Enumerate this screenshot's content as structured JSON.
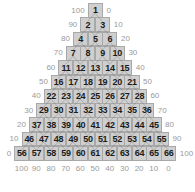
{
  "diagram": {
    "type": "ternary-triangle-grid",
    "rows": [
      [
        1
      ],
      [
        2,
        3
      ],
      [
        4,
        5,
        6
      ],
      [
        7,
        8,
        9,
        10
      ],
      [
        11,
        12,
        13,
        14,
        15
      ],
      [
        16,
        17,
        18,
        19,
        20,
        21
      ],
      [
        22,
        23,
        24,
        25,
        26,
        27,
        28
      ],
      [
        29,
        30,
        31,
        32,
        33,
        34,
        35,
        36
      ],
      [
        37,
        38,
        39,
        40,
        41,
        42,
        43,
        44,
        45
      ],
      [
        46,
        47,
        48,
        49,
        50,
        51,
        52,
        53,
        54,
        55
      ],
      [
        56,
        57,
        58,
        59,
        60,
        61,
        62,
        63,
        64,
        65,
        66
      ]
    ],
    "left_axis_labels": [
      "100",
      "90",
      "80",
      "70",
      "60",
      "50",
      "40",
      "30",
      "20",
      "10",
      "0"
    ],
    "right_axis_labels": [
      "0",
      "10",
      "20",
      "30",
      "40",
      "50",
      "60",
      "70",
      "80",
      "90",
      "100"
    ],
    "bottom_axis_labels": [
      "100",
      "90",
      "80",
      "70",
      "60",
      "50",
      "40",
      "30",
      "20",
      "10",
      "0"
    ],
    "colors": {
      "cell_fill": "#cfcfcf",
      "cell_border": "#a8a8a8",
      "cell_text": "#1a1a1a",
      "label_text": "#9a9a9a",
      "arrow": "#555555"
    }
  }
}
